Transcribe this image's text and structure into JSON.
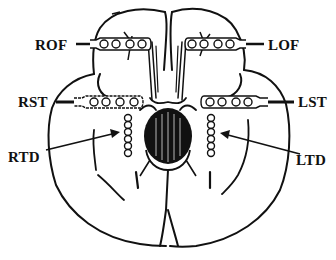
{
  "diagram": {
    "colors": {
      "ink": "#111111",
      "background": "#ffffff"
    },
    "labels": {
      "rof": "ROF",
      "lof": "LOF",
      "rst": "RST",
      "lst": "LST",
      "rtd": "RTD",
      "ltd": "LTD"
    },
    "electrodes": [
      {
        "id": "ROF",
        "type": "strip",
        "side": "right",
        "region": "orbitofrontal",
        "contacts": 4
      },
      {
        "id": "LOF",
        "type": "strip",
        "side": "left",
        "region": "orbitofrontal",
        "contacts": 4
      },
      {
        "id": "RST",
        "type": "strip",
        "side": "right",
        "region": "subtemporal",
        "contacts": 4
      },
      {
        "id": "LST",
        "type": "strip",
        "side": "left",
        "region": "subtemporal",
        "contacts": 4
      },
      {
        "id": "RTD",
        "type": "depth",
        "side": "right",
        "region": "temporal depth",
        "contacts": 6
      },
      {
        "id": "LTD",
        "type": "depth",
        "side": "left",
        "region": "temporal depth",
        "contacts": 6
      }
    ]
  }
}
